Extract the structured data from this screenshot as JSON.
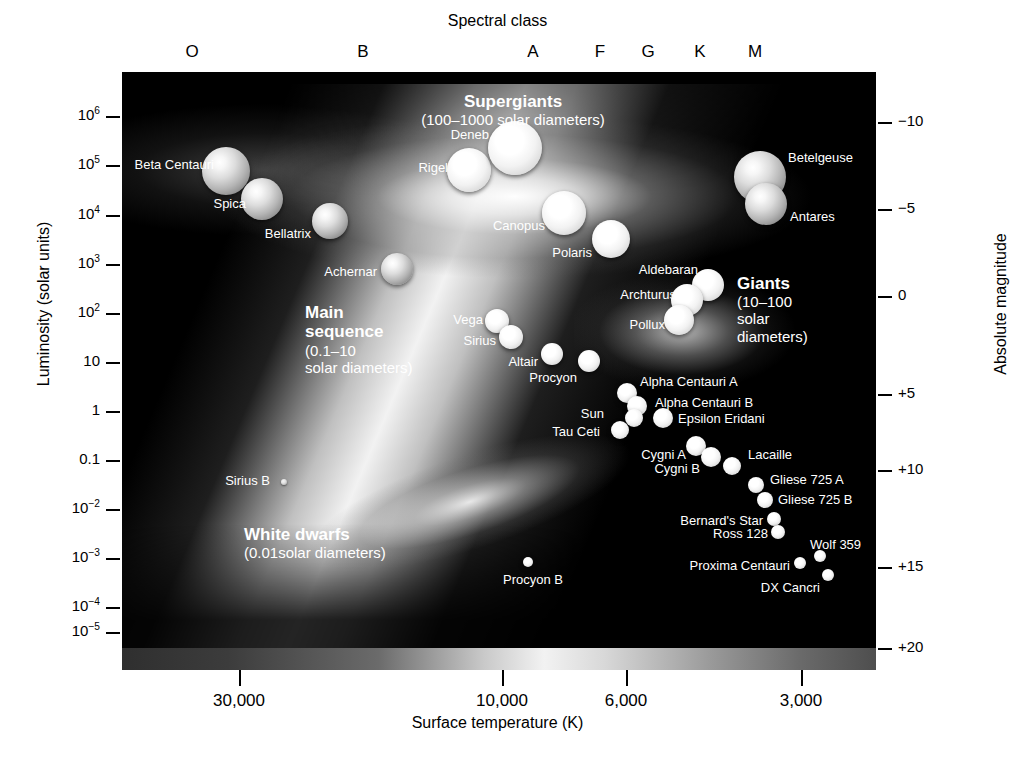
{
  "figure": {
    "title_top": "Spectral class",
    "xlabel": "Surface temperature (K)",
    "ylabel_left": "Luminosity (solar units)",
    "ylabel_right": "Absolute magnitude",
    "caption": ""
  },
  "chart_data": {
    "type": "scatter",
    "xlabel": "Surface temperature (K)",
    "ylabel": "Luminosity (solar units)",
    "ylabel_right": "Absolute magnitude",
    "xlabel_top": "Spectral class",
    "grid": false,
    "legend": "none",
    "x_axis": {
      "scale": "log-reversed",
      "tick_labels": [
        "30,000",
        "10,000",
        "6,000",
        "3,000"
      ],
      "tick_px": [
        239,
        502,
        626,
        801
      ]
    },
    "spectral_class_ticks": {
      "labels": [
        "O",
        "B",
        "A",
        "F",
        "G",
        "K",
        "M"
      ],
      "px": [
        192,
        363,
        533,
        600,
        648,
        700,
        755
      ]
    },
    "y_axis_left": {
      "scale": "log",
      "tick_labels": [
        "10⁶",
        "10⁵",
        "10⁴",
        "10³",
        "10²",
        "10",
        "1",
        "0.1",
        "10⁻²",
        "10⁻³",
        "10⁻⁴",
        "10⁻⁵"
      ],
      "tick_bases": [
        "10",
        "10",
        "10",
        "10",
        "10",
        "10",
        "1",
        "0.1",
        "10",
        "10",
        "10",
        "10"
      ],
      "tick_exps": [
        "6",
        "5",
        "4",
        "3",
        "2",
        "",
        "",
        "",
        "−2",
        "−3",
        "−4",
        "−5"
      ],
      "tick_py": [
        116,
        165,
        215,
        264,
        313,
        362,
        411,
        460,
        509,
        558,
        607,
        632
      ]
    },
    "y_axis_right": {
      "tick_labels": [
        "−10",
        "−5",
        "0",
        "+5",
        "+10",
        "+15",
        "+20"
      ],
      "tick_py": [
        122,
        209,
        296,
        394,
        470,
        567,
        648
      ]
    },
    "groups": [
      {
        "name": "Supergiants",
        "title": "Supergiants",
        "subtitle": "(100–1000 solar diameters)",
        "diameter_range_solar": [
          100,
          1000
        ]
      },
      {
        "name": "Giants",
        "title": "Giants",
        "subtitle": "(10–100 solar diameters)",
        "subtitle_lines": [
          "(10–100",
          "solar",
          "diameters)"
        ],
        "diameter_range_solar": [
          10,
          100
        ]
      },
      {
        "name": "Main sequence",
        "title_lines": [
          "Main",
          "sequence"
        ],
        "subtitle_lines": [
          "(0.1–10",
          "solar diameters)"
        ],
        "diameter_range_solar": [
          0.1,
          10
        ]
      },
      {
        "name": "White dwarfs",
        "title": "White dwarfs",
        "subtitle": "(0.01solar diameters)",
        "diameter_range_solar": [
          0.01,
          0.01
        ]
      }
    ],
    "stars": [
      {
        "name": "Beta Centauri",
        "cx": 226,
        "cy": 171,
        "r": 24,
        "label_side": "r",
        "lx": 214,
        "ly": 165,
        "tone": "normal"
      },
      {
        "name": "Spica",
        "cx": 262,
        "cy": 199,
        "r": 21,
        "label_side": "r",
        "lx": 246,
        "ly": 204,
        "tone": "normal"
      },
      {
        "name": "Bellatrix",
        "cx": 330,
        "cy": 221,
        "r": 18,
        "label_side": "r",
        "lx": 311,
        "ly": 234,
        "tone": "normal"
      },
      {
        "name": "Achernar",
        "cx": 397,
        "cy": 269,
        "r": 16,
        "label_side": "r",
        "lx": 377,
        "ly": 272,
        "tone": "normal"
      },
      {
        "name": "Rigel",
        "cx": 469,
        "cy": 170,
        "r": 22,
        "label_side": "r",
        "lx": 448,
        "ly": 168,
        "tone": "bright"
      },
      {
        "name": "Deneb",
        "cx": 515,
        "cy": 148,
        "r": 27,
        "label_side": "r",
        "lx": 489,
        "ly": 135,
        "tone": "bright"
      },
      {
        "name": "Canopus",
        "cx": 564,
        "cy": 213,
        "r": 22,
        "label_side": "r",
        "lx": 545,
        "ly": 226,
        "tone": "bright"
      },
      {
        "name": "Polaris",
        "cx": 611,
        "cy": 239,
        "r": 19,
        "label_side": "r",
        "lx": 592,
        "ly": 253,
        "tone": "bright"
      },
      {
        "name": "Betelgeuse",
        "cx": 760,
        "cy": 177,
        "r": 26,
        "label_side": "l",
        "lx": 788,
        "ly": 158,
        "tone": "normal"
      },
      {
        "name": "Antares",
        "cx": 766,
        "cy": 204,
        "r": 21,
        "label_side": "l",
        "lx": 790,
        "ly": 217,
        "tone": "normal"
      },
      {
        "name": "Aldebaran",
        "cx": 708,
        "cy": 285,
        "r": 16,
        "label_side": "r",
        "lx": 698,
        "ly": 270,
        "tone": "bright"
      },
      {
        "name": "Archturus",
        "cx": 687,
        "cy": 300,
        "r": 16,
        "label_side": "r",
        "lx": 676,
        "ly": 295,
        "tone": "bright"
      },
      {
        "name": "Pollux",
        "cx": 679,
        "cy": 320,
        "r": 15,
        "label_side": "r",
        "lx": 665,
        "ly": 325,
        "tone": "bright"
      },
      {
        "name": "Vega",
        "cx": 497,
        "cy": 321,
        "r": 12,
        "label_side": "r",
        "lx": 483,
        "ly": 320,
        "tone": "bright"
      },
      {
        "name": "Sirius",
        "cx": 511,
        "cy": 337,
        "r": 12,
        "label_side": "r",
        "lx": 496,
        "ly": 341,
        "tone": "bright"
      },
      {
        "name": "Altair",
        "cx": 552,
        "cy": 354,
        "r": 11,
        "label_side": "r",
        "lx": 538,
        "ly": 362,
        "tone": "bright"
      },
      {
        "name": "Procyon",
        "cx": 589,
        "cy": 361,
        "r": 11,
        "label_side": "r",
        "lx": 577,
        "ly": 378,
        "tone": "bright"
      },
      {
        "name": "Alpha Centauri A",
        "cx": 627,
        "cy": 393,
        "r": 10,
        "label_side": "l",
        "lx": 640,
        "ly": 382,
        "tone": "bright"
      },
      {
        "name": "Alpha Centauri B",
        "cx": 637,
        "cy": 406,
        "r": 10,
        "label_side": "l",
        "lx": 655,
        "ly": 403,
        "tone": "bright"
      },
      {
        "name": "Epsilon Eridani",
        "cx": 663,
        "cy": 418,
        "r": 10,
        "label_side": "l",
        "lx": 678,
        "ly": 419,
        "tone": "bright"
      },
      {
        "name": "Sun",
        "cx": 634,
        "cy": 418,
        "r": 9,
        "label_side": "r",
        "lx": 604,
        "ly": 414,
        "tone": "bright"
      },
      {
        "name": "Tau Ceti",
        "cx": 620,
        "cy": 430,
        "r": 9,
        "label_side": "r",
        "lx": 600,
        "ly": 432,
        "tone": "bright"
      },
      {
        "name": "Cygni A",
        "cx": 696,
        "cy": 446,
        "r": 10,
        "label_side": "r",
        "lx": 686,
        "ly": 455,
        "tone": "bright"
      },
      {
        "name": "Cygni B",
        "cx": 711,
        "cy": 457,
        "r": 10,
        "label_side": "r",
        "lx": 700,
        "ly": 469,
        "tone": "bright"
      },
      {
        "name": "Lacaille",
        "cx": 732,
        "cy": 466,
        "r": 9,
        "label_side": "l",
        "lx": 748,
        "ly": 455,
        "tone": "bright"
      },
      {
        "name": "Gliese 725 A",
        "cx": 756,
        "cy": 485,
        "r": 8,
        "label_side": "l",
        "lx": 770,
        "ly": 480,
        "tone": "bright"
      },
      {
        "name": "Gliese 725 B",
        "cx": 765,
        "cy": 500,
        "r": 8,
        "label_side": "l",
        "lx": 778,
        "ly": 500,
        "tone": "bright"
      },
      {
        "name": "Bernard's Star",
        "cx": 774,
        "cy": 519,
        "r": 7,
        "label_side": "r",
        "lx": 763,
        "ly": 521,
        "tone": "bright"
      },
      {
        "name": "Ross 128",
        "cx": 778,
        "cy": 532,
        "r": 7,
        "label_side": "r",
        "lx": 768,
        "ly": 534,
        "tone": "bright"
      },
      {
        "name": "Wolf 359",
        "cx": 820,
        "cy": 556,
        "r": 6,
        "label_side": "l",
        "lx": 810,
        "ly": 545,
        "tone": "bright"
      },
      {
        "name": "Proxima Centauri",
        "cx": 800,
        "cy": 563,
        "r": 6,
        "label_side": "r",
        "lx": 790,
        "ly": 566,
        "tone": "bright"
      },
      {
        "name": "DX Cancri",
        "cx": 828,
        "cy": 575,
        "r": 6,
        "label_side": "r",
        "lx": 820,
        "ly": 588,
        "tone": "bright"
      },
      {
        "name": "Sirius B",
        "cx": 284,
        "cy": 482,
        "r": 3,
        "label_side": "r",
        "lx": 270,
        "ly": 481,
        "tone": "dim"
      },
      {
        "name": "Procyon B",
        "cx": 528,
        "cy": 562,
        "r": 5,
        "label_side": "r",
        "lx": 563,
        "ly": 580,
        "tone": "bright"
      }
    ]
  }
}
